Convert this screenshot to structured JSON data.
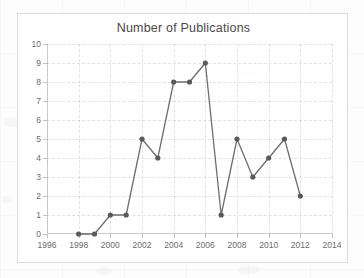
{
  "chart_data": {
    "type": "line",
    "title": "Number of Publications",
    "xlabel": "",
    "ylabel": "",
    "xlim": [
      1996,
      2014
    ],
    "ylim": [
      0,
      10
    ],
    "grid": true,
    "legend": "none",
    "marker": "circle",
    "line_color": "#6e6e6e",
    "marker_color": "#595959",
    "x_tick_labels": [
      "1996",
      "1998",
      "2000",
      "2002",
      "2004",
      "2006",
      "2008",
      "2010",
      "2012",
      "2014"
    ],
    "x_ticks": [
      1996,
      1998,
      2000,
      2002,
      2004,
      2006,
      2008,
      2010,
      2012,
      2014
    ],
    "y_tick_labels": [
      "0",
      "1",
      "2",
      "3",
      "4",
      "5",
      "6",
      "7",
      "8",
      "9",
      "10"
    ],
    "y_ticks": [
      0,
      1,
      2,
      3,
      4,
      5,
      6,
      7,
      8,
      9,
      10
    ],
    "x": [
      1998,
      1999,
      2000,
      2001,
      2002,
      2003,
      2004,
      2005,
      2006,
      2007,
      2008,
      2009,
      2010,
      2011,
      2012
    ],
    "values": [
      0,
      0,
      1,
      1,
      5,
      4,
      8,
      8,
      9,
      1,
      5,
      3,
      4,
      5,
      2
    ],
    "series": [
      {
        "name": "Number of Publications",
        "x": [
          1998,
          1999,
          2000,
          2001,
          2002,
          2003,
          2004,
          2005,
          2006,
          2007,
          2008,
          2009,
          2010,
          2011,
          2012
        ],
        "values": [
          0,
          0,
          1,
          1,
          5,
          4,
          8,
          8,
          9,
          1,
          5,
          3,
          4,
          5,
          2
        ]
      }
    ]
  },
  "colors": {
    "background": "#ffffff",
    "frame": "#dcdcdc",
    "axis": "#c9c9c9",
    "gridline": "#97a0af",
    "text": "#6b6b6b",
    "title_text": "#4a4a4a",
    "line": "#6e6e6e",
    "marker": "#595959"
  }
}
